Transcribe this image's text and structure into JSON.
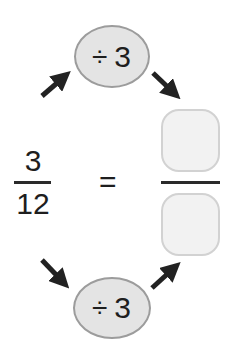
{
  "left_fraction": {
    "numerator": "3",
    "denominator": "12"
  },
  "equals_sign": "=",
  "right_fraction": {
    "numerator": "",
    "denominator": ""
  },
  "top_operation": {
    "operator": "÷",
    "operand": "3"
  },
  "bottom_operation": {
    "operator": "÷",
    "operand": "3"
  },
  "icons": {
    "arrow_up_right": "arrow-up-right-icon",
    "arrow_down_right": "arrow-down-right-icon"
  },
  "colors": {
    "ellipse_fill": "#e4e4e4",
    "ellipse_border": "#9c9c9c",
    "box_fill": "#f2f2f2",
    "box_border": "#d2d2d2",
    "text": "#1e1e1e"
  }
}
